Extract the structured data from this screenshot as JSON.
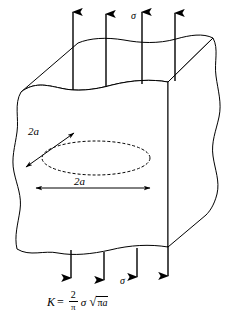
{
  "figure": {
    "name": "penny-shaped-crack-under-tension"
  },
  "labels": {
    "sigma_top": "σ",
    "sigma_bottom": "σ",
    "dim_minor": "2a",
    "dim_major": "2a"
  },
  "formula": {
    "lhs": "K",
    "equals": "=",
    "numerator": "2",
    "denominator": "π",
    "sigma": "σ",
    "radical_sign": "√",
    "radicand_pi": "π",
    "radicand_a": "a",
    "plain_text": "K = (2/π) σ √(πa)"
  },
  "arrows": {
    "top_count": 4,
    "bottom_count": 4,
    "top_direction": "up",
    "bottom_direction": "down"
  },
  "style": {
    "stroke": "#000000",
    "background": "#ffffff",
    "crack_dash": "3 2"
  }
}
